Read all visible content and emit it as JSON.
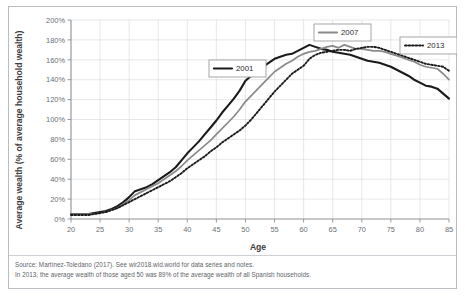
{
  "figure": {
    "axis_label_x": "Age",
    "axis_label_y": "Average wealth (% of average household wealth)",
    "notes": {
      "source_line": "Source: Martínez-Toledano (2017). See wir2018.wid.world for data series and notes.",
      "reading_line": "In 2013, the average wealth of those aged 50 was 89% of the average wealth of all Spanish households."
    }
  },
  "legend": {
    "items": [
      {
        "label": "2001",
        "color": "#1a1a1a",
        "style": "solid"
      },
      {
        "label": "2007",
        "color": "#8a8a8a",
        "style": "solid"
      },
      {
        "label": "2013",
        "color": "#1a1a1a",
        "style": "dotted"
      }
    ]
  },
  "colors": {
    "series_2001": "#1a1a1a",
    "series_2007": "#8a8a8a",
    "series_2013": "#1a1a1a",
    "grid": "#d6d9dd",
    "axis": "#8b8f93",
    "frame": "#b9bcc0",
    "note_text": "#5d6368"
  },
  "chart_data": {
    "type": "line",
    "title": "",
    "xlabel": "Age",
    "ylabel": "Average wealth (% of average household wealth)",
    "xlim": [
      20,
      85
    ],
    "ylim": [
      0,
      200
    ],
    "xticks": [
      20,
      25,
      30,
      35,
      40,
      45,
      50,
      55,
      60,
      65,
      70,
      75,
      80,
      85
    ],
    "yticks": [
      0,
      20,
      40,
      60,
      80,
      100,
      120,
      140,
      160,
      180,
      200
    ],
    "ytick_labels": [
      "0%",
      "20%",
      "40%",
      "60%",
      "80%",
      "100%",
      "120%",
      "140%",
      "160%",
      "180%",
      "200%"
    ],
    "grid": true,
    "legend_position": "inside",
    "x": [
      20,
      21,
      22,
      23,
      24,
      25,
      26,
      27,
      28,
      29,
      30,
      31,
      32,
      33,
      34,
      35,
      36,
      37,
      38,
      39,
      40,
      41,
      42,
      43,
      44,
      45,
      46,
      47,
      48,
      49,
      50,
      51,
      52,
      53,
      54,
      55,
      56,
      57,
      58,
      59,
      60,
      61,
      62,
      63,
      64,
      65,
      66,
      67,
      68,
      69,
      70,
      71,
      72,
      73,
      74,
      75,
      76,
      77,
      78,
      79,
      80,
      81,
      82,
      83,
      84,
      85
    ],
    "series": [
      {
        "name": "2001",
        "values": [
          5,
          5,
          5,
          5,
          6,
          7,
          8,
          10,
          13,
          17,
          22,
          28,
          30,
          32,
          35,
          39,
          43,
          47,
          52,
          59,
          66,
          72,
          78,
          85,
          92,
          99,
          107,
          114,
          121,
          129,
          139,
          144,
          149,
          153,
          157,
          161,
          163,
          165,
          166,
          169,
          172,
          175,
          173,
          171,
          170,
          168,
          167,
          166,
          165,
          163,
          161,
          159,
          158,
          157,
          155,
          153,
          150,
          147,
          144,
          140,
          137,
          134,
          133,
          131,
          126,
          121
        ]
      },
      {
        "name": "2007",
        "values": [
          5,
          5,
          5,
          5,
          5,
          6,
          7,
          9,
          11,
          15,
          19,
          24,
          27,
          30,
          33,
          36,
          40,
          44,
          48,
          53,
          59,
          64,
          69,
          74,
          79,
          85,
          91,
          97,
          103,
          110,
          118,
          124,
          130,
          136,
          142,
          148,
          152,
          156,
          159,
          163,
          166,
          168,
          169,
          171,
          173,
          174,
          172,
          175,
          173,
          171,
          171,
          170,
          169,
          169,
          168,
          166,
          164,
          162,
          160,
          158,
          155,
          153,
          152,
          151,
          146,
          140
        ]
      },
      {
        "name": "2013",
        "values": [
          4,
          4,
          4,
          4,
          5,
          6,
          7,
          9,
          11,
          14,
          17,
          20,
          23,
          26,
          29,
          32,
          35,
          38,
          42,
          46,
          51,
          55,
          59,
          63,
          68,
          72,
          77,
          81,
          85,
          89,
          94,
          100,
          107,
          114,
          121,
          128,
          134,
          140,
          146,
          150,
          154,
          161,
          165,
          167,
          168,
          169,
          170,
          170,
          169,
          171,
          172,
          173,
          173,
          172,
          170,
          168,
          166,
          164,
          162,
          160,
          158,
          156,
          155,
          154,
          153,
          149
        ]
      }
    ],
    "annotation": "In 2013, the average wealth of those aged 50 was 89% of the average wealth of all Spanish households."
  }
}
